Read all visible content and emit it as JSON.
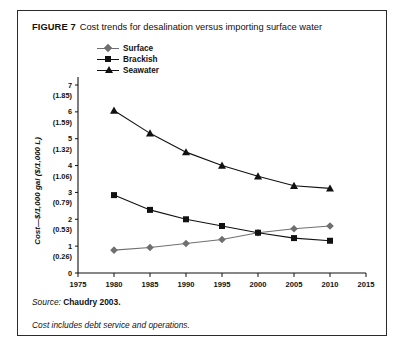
{
  "figure": {
    "label": "FIGURE 7",
    "title": "Cost trends for desalination versus importing surface water"
  },
  "notes": [
    {
      "lead": "Source:",
      "rest": " Chaudry 2003."
    },
    {
      "lead": "",
      "rest": "Cost includes debt service and operations."
    }
  ],
  "legend": {
    "position": "top-left-inside",
    "items": [
      {
        "label": "Surface",
        "marker": "diamond-marker",
        "color": "#6f6f6f"
      },
      {
        "label": "Brackish",
        "marker": "square-marker",
        "color": "#111111"
      },
      {
        "label": "Seawater",
        "marker": "triangle-marker",
        "color": "#111111"
      }
    ]
  },
  "chart_data": {
    "type": "line",
    "title": "Cost trends for desalination versus importing surface water",
    "xlabel": "Year",
    "ylabel": "Cost—$/1,000 gal ($/1,000 L)",
    "xlim": [
      1975,
      2015
    ],
    "ylim": [
      0,
      7
    ],
    "grid": false,
    "x": [
      1980,
      1985,
      1990,
      1995,
      2000,
      2005,
      2010
    ],
    "xticks": [
      1975,
      1980,
      1985,
      1990,
      1995,
      2000,
      2005,
      2010,
      2015
    ],
    "yticks": [
      0,
      1,
      2,
      3,
      4,
      5,
      6,
      7
    ],
    "ytick_secondary_labels": [
      "",
      "(0.26)",
      "(0.53)",
      "(0.79)",
      "(1.06)",
      "(1.32)",
      "(1.59)",
      "(1.85)"
    ],
    "series": [
      {
        "name": "Surface",
        "marker": "diamond",
        "color": "#6f6f6f",
        "values": [
          0.85,
          0.95,
          1.1,
          1.25,
          1.5,
          1.65,
          1.75
        ]
      },
      {
        "name": "Brackish",
        "marker": "square",
        "color": "#111111",
        "values": [
          2.9,
          2.35,
          2.0,
          1.75,
          1.5,
          1.3,
          1.2
        ]
      },
      {
        "name": "Seawater",
        "marker": "triangle",
        "color": "#111111",
        "values": [
          6.05,
          5.2,
          4.5,
          4.0,
          3.6,
          3.25,
          3.15
        ]
      }
    ]
  }
}
